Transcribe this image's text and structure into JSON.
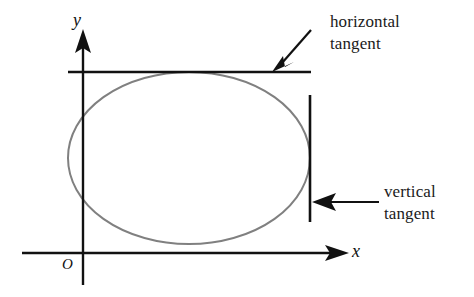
{
  "figure": {
    "background_color": "#ffffff",
    "axis_color": "#111111",
    "curve_color": "#808080",
    "annotation_color": "#1a1a1a"
  },
  "axes": {
    "x_label": "x",
    "y_label": "y",
    "origin_label": "O",
    "x_axis": {
      "x1": 22,
      "y1": 253,
      "x2": 348,
      "y2": 253,
      "arrow": "right"
    },
    "y_axis": {
      "x1": 83,
      "y1": 285,
      "x2": 83,
      "y2": 30,
      "arrow": "up"
    }
  },
  "curve": {
    "type": "ellipse",
    "center_x": 189,
    "center_y": 158,
    "radius_x": 121,
    "radius_y": 86,
    "stroke_width": 2
  },
  "tangents": [
    {
      "name": "horizontal-tangent",
      "orientation": "horizontal",
      "x1": 68,
      "y1": 72,
      "x2": 311,
      "y2": 72,
      "touch_point_x": 189,
      "touch_point_y": 72
    },
    {
      "name": "vertical-tangent",
      "orientation": "vertical",
      "x1": 310,
      "y1": 95,
      "x2": 310,
      "y2": 222,
      "touch_point_x": 310,
      "touch_point_y": 158
    }
  ],
  "annotations": [
    {
      "id": "horizontal",
      "line1": "horizontal",
      "line2": "tangent",
      "arrow": {
        "x1": 311,
        "y1": 30,
        "x2": 276,
        "y2": 70
      }
    },
    {
      "id": "vertical",
      "line1": "vertical",
      "line2": "tangent",
      "arrow": {
        "x1": 379,
        "y1": 202,
        "x2": 314,
        "y2": 202
      }
    }
  ]
}
